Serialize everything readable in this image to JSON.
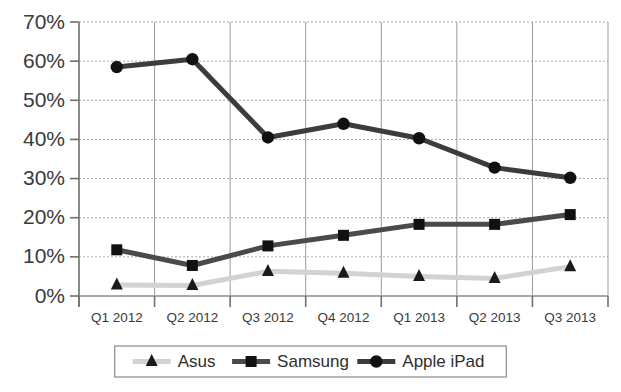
{
  "chart_data": {
    "type": "line",
    "title": "",
    "xlabel": "",
    "ylabel": "",
    "categories": [
      "Q1 2012",
      "Q2 2012",
      "Q3 2012",
      "Q4 2012",
      "Q1 2013",
      "Q2 2013",
      "Q3 2013"
    ],
    "ylim": [
      0,
      70
    ],
    "ytick_labels": [
      "0%",
      "10%",
      "20%",
      "30%",
      "40%",
      "50%",
      "60%",
      "70%"
    ],
    "ytick_values": [
      0,
      10,
      20,
      30,
      40,
      50,
      60,
      70
    ],
    "grid": true,
    "legend_position": "bottom",
    "series": [
      {
        "name": "Asus",
        "marker": "triangle",
        "line_color": "#d2d2d2",
        "marker_color": "#1a1a1a",
        "values": [
          2.8,
          2.7,
          6.3,
          5.8,
          5.0,
          4.5,
          7.5
        ]
      },
      {
        "name": "Samsung",
        "marker": "square",
        "line_color": "#4a4a4a",
        "marker_color": "#111111",
        "values": [
          11.8,
          7.8,
          12.8,
          15.5,
          18.3,
          18.3,
          20.8
        ]
      },
      {
        "name": "Apple iPad",
        "marker": "circle",
        "line_color": "#3c3c3c",
        "marker_color": "#111111",
        "values": [
          58.5,
          60.5,
          40.5,
          44.0,
          40.3,
          32.8,
          30.2
        ]
      }
    ]
  },
  "legend": {
    "items": [
      {
        "label": "Asus"
      },
      {
        "label": "Samsung"
      },
      {
        "label": "Apple iPad"
      }
    ]
  },
  "colors": {
    "background": "#ffffff",
    "grid": "#a8a8a8",
    "axis": "#8c8c8c",
    "text": "#3a3a3a"
  }
}
